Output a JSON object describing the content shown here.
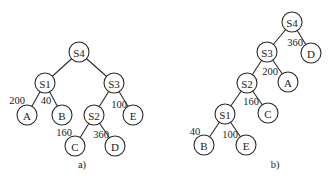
{
  "node_radius": 10,
  "trees": [
    {
      "id": "a",
      "caption": "a)",
      "caption_pos": [
        82,
        164
      ],
      "nodes": [
        {
          "id": "S4",
          "label": "S4",
          "x": 79,
          "y": 52
        },
        {
          "id": "S1",
          "label": "S1",
          "x": 45,
          "y": 83
        },
        {
          "id": "S3",
          "label": "S3",
          "x": 114,
          "y": 83
        },
        {
          "id": "A",
          "label": "A",
          "x": 27,
          "y": 115
        },
        {
          "id": "B",
          "label": "B",
          "x": 62,
          "y": 115
        },
        {
          "id": "S2",
          "label": "S2",
          "x": 94,
          "y": 115
        },
        {
          "id": "E",
          "label": "E",
          "x": 133,
          "y": 115
        },
        {
          "id": "C",
          "label": "C",
          "x": 75,
          "y": 146
        },
        {
          "id": "D",
          "label": "D",
          "x": 115,
          "y": 146
        }
      ],
      "edges": [
        {
          "from": "S4",
          "to": "S1"
        },
        {
          "from": "S4",
          "to": "S3"
        },
        {
          "from": "S1",
          "to": "A",
          "weight": "200",
          "label_pos": [
            17,
            100
          ]
        },
        {
          "from": "S1",
          "to": "B",
          "weight": "40",
          "label_pos": [
            46,
            100
          ]
        },
        {
          "from": "S3",
          "to": "S2"
        },
        {
          "from": "S3",
          "to": "E",
          "weight": "100",
          "label_pos": [
            119,
            104
          ]
        },
        {
          "from": "S2",
          "to": "C",
          "weight": "160",
          "label_pos": [
            64,
            132
          ]
        },
        {
          "from": "S2",
          "to": "D",
          "weight": "360",
          "label_pos": [
            101,
            134
          ]
        }
      ]
    },
    {
      "id": "b",
      "caption": "b)",
      "caption_pos": [
        275,
        164
      ],
      "nodes": [
        {
          "id": "S4",
          "label": "S4",
          "x": 292,
          "y": 22
        },
        {
          "id": "S3",
          "label": "S3",
          "x": 267,
          "y": 52
        },
        {
          "id": "D",
          "label": "D",
          "x": 311,
          "y": 53
        },
        {
          "id": "S2",
          "label": "S2",
          "x": 247,
          "y": 83
        },
        {
          "id": "A",
          "label": "A",
          "x": 288,
          "y": 82
        },
        {
          "id": "S1",
          "label": "S1",
          "x": 225,
          "y": 114
        },
        {
          "id": "C",
          "label": "C",
          "x": 268,
          "y": 113
        },
        {
          "id": "B",
          "label": "B",
          "x": 204,
          "y": 145
        },
        {
          "id": "E",
          "label": "E",
          "x": 246,
          "y": 145
        }
      ],
      "edges": [
        {
          "from": "S4",
          "to": "S3"
        },
        {
          "from": "S4",
          "to": "D",
          "weight": "360",
          "label_pos": [
            295,
            42
          ]
        },
        {
          "from": "S3",
          "to": "S2"
        },
        {
          "from": "S3",
          "to": "A",
          "weight": "200",
          "label_pos": [
            270,
            71
          ]
        },
        {
          "from": "S2",
          "to": "S1"
        },
        {
          "from": "S2",
          "to": "C",
          "weight": "160",
          "label_pos": [
            251,
            101
          ]
        },
        {
          "from": "S1",
          "to": "B",
          "weight": "40",
          "label_pos": [
            195,
            131
          ]
        },
        {
          "from": "S1",
          "to": "E",
          "weight": "100",
          "label_pos": [
            230,
            134
          ]
        }
      ]
    }
  ]
}
